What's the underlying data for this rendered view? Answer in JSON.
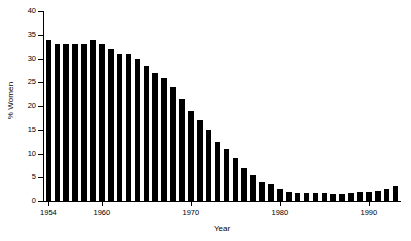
{
  "chart_data": {
    "type": "bar",
    "title": "",
    "xlabel": "Year",
    "ylabel": "% Women",
    "xlim": [
      1953.5,
      1993.5
    ],
    "ylim": [
      0,
      40
    ],
    "grid": false,
    "legend": null,
    "ytick_values": [
      0,
      5,
      10,
      15,
      20,
      25,
      30,
      35,
      40
    ],
    "ytick_labels": [
      "0",
      "5",
      "10",
      "15",
      "20",
      "25",
      "30",
      "35",
      "40"
    ],
    "xtick_values": [
      1954,
      1960,
      1970,
      1980,
      1990
    ],
    "xtick_labels": [
      "1954",
      "1960",
      "1970",
      "1980",
      "1990"
    ],
    "bar_color": "#000000",
    "categories": [
      1954,
      1955,
      1956,
      1957,
      1958,
      1959,
      1960,
      1961,
      1962,
      1963,
      1964,
      1965,
      1966,
      1967,
      1968,
      1969,
      1970,
      1971,
      1972,
      1973,
      1974,
      1975,
      1976,
      1977,
      1978,
      1979,
      1980,
      1981,
      1982,
      1983,
      1984,
      1985,
      1986,
      1987,
      1988,
      1989,
      1990,
      1991,
      1992,
      1993
    ],
    "values": [
      34.0,
      33.0,
      33.0,
      33.0,
      33.0,
      34.0,
      33.0,
      32.0,
      31.0,
      31.0,
      30.0,
      28.5,
      27.0,
      26.0,
      24.0,
      21.5,
      19.0,
      17.0,
      15.0,
      12.5,
      11.0,
      9.0,
      7.0,
      5.5,
      4.0,
      3.5,
      2.5,
      2.0,
      1.7,
      1.7,
      1.6,
      1.6,
      1.5,
      1.5,
      1.6,
      1.8,
      2.0,
      2.2,
      2.6,
      3.2
    ]
  }
}
